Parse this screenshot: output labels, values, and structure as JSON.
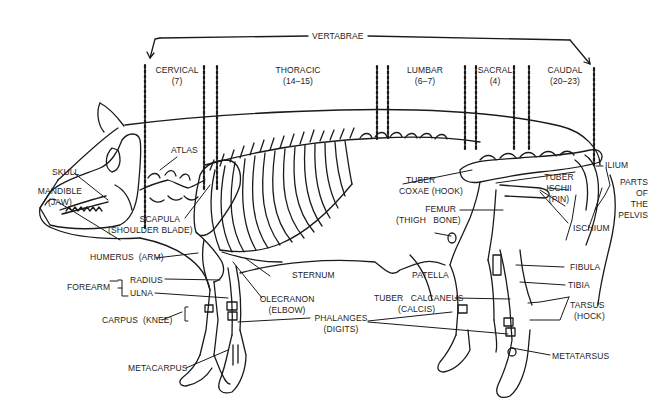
{
  "diagram": {
    "vertebrae": {
      "label": "VERTABRAE",
      "regions": [
        {
          "name": "CERVICAL",
          "count": "(7)"
        },
        {
          "name": "THORACIC",
          "count": "(14–15)"
        },
        {
          "name": "LUMBAR",
          "count": "(6–7)"
        },
        {
          "name": "SACRAL",
          "count": "(4)"
        },
        {
          "name": "CAUDAL",
          "count": "(20–23)"
        }
      ]
    },
    "labels": {
      "skull": "SKULL",
      "mandible": "MANDIBLE",
      "mandible_alt": "(JAW)",
      "atlas": "ATLAS",
      "scapula": "SCAPULA",
      "scapula_alt": "(SHOULDER BLADE)",
      "humerus": "HUMERUS",
      "humerus_alt": "(ARM)",
      "forearm": "FOREARM",
      "radius": "RADIUS",
      "ulna": "ULNA",
      "carpus": "CARPUS",
      "carpus_alt": "(KNEE)",
      "metacarpus": "METACARPUS",
      "sternum": "STERNUM",
      "olecranon": "OLECRANON",
      "olecranon_alt": "(ELBOW)",
      "phalanges": "PHALANGES",
      "phalanges_alt": "(DIGITS)",
      "tuber_coxae": "TUBER",
      "tuber_coxae_2": "COXAE (HOOK)",
      "femur": "FEMUR",
      "femur_alt": "(THIGH   BONE)",
      "patella": "PATELLA",
      "tuber_calcaneus": "TUBER   CALCANEUS",
      "tuber_calcaneus_alt": "(CALCIS)",
      "tuber_ischii": "TUBER",
      "tuber_ischii_2": "ISCHII",
      "tuber_ischii_alt": "(PIN)",
      "ilium": "ILIUM",
      "ischium": "ISCHIUM",
      "pelvis_1": "PARTS",
      "pelvis_2": "OF",
      "pelvis_3": "THE",
      "pelvis_4": "PELVIS",
      "fibula": "FIBULA",
      "tibia": "TIBIA",
      "tarsus": "TARSUS",
      "tarsus_alt": "(HOCK)",
      "metatarsus": "METATARSUS"
    },
    "colors": {
      "ink": "#1a1a1a",
      "background": "#ffffff"
    }
  }
}
